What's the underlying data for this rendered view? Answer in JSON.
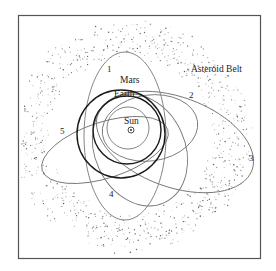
{
  "diagram": {
    "type": "orbital-diagram",
    "labels": {
      "asteroid_belt": "Asteroid Belt",
      "mars": "Mars",
      "earth": "Earth",
      "sun": "Sun",
      "sun_symbol": "⊙",
      "orbit_1": "1",
      "orbit_2": "2",
      "orbit_3": "3",
      "orbit_4": "4",
      "orbit_5": "5"
    },
    "colors": {
      "frame": "#555555",
      "planet_orbit": "#1a1a1a",
      "object_orbit": "#777777",
      "belt_dots": "#444444",
      "text": "#222222"
    }
  }
}
